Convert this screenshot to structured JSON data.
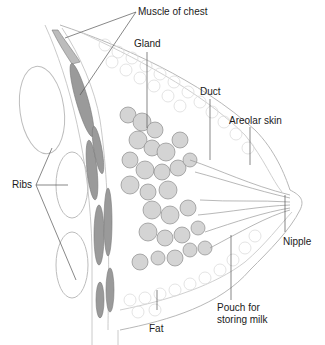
{
  "diagram": {
    "labels": {
      "muscle": "Muscle of chest",
      "gland": "Gland",
      "duct": "Duct",
      "areolar": "Areolar skin",
      "ribs": "Ribs",
      "nipple": "Nipple",
      "pouch_line1": "Pouch for",
      "pouch_line2": "storing milk",
      "fat": "Fat"
    },
    "colors": {
      "muscle": "#9a9a9a",
      "gland": "#cfcfcf",
      "outline": "#b5b5b5",
      "leader": "#555555",
      "text": "#1a1a1a"
    }
  }
}
